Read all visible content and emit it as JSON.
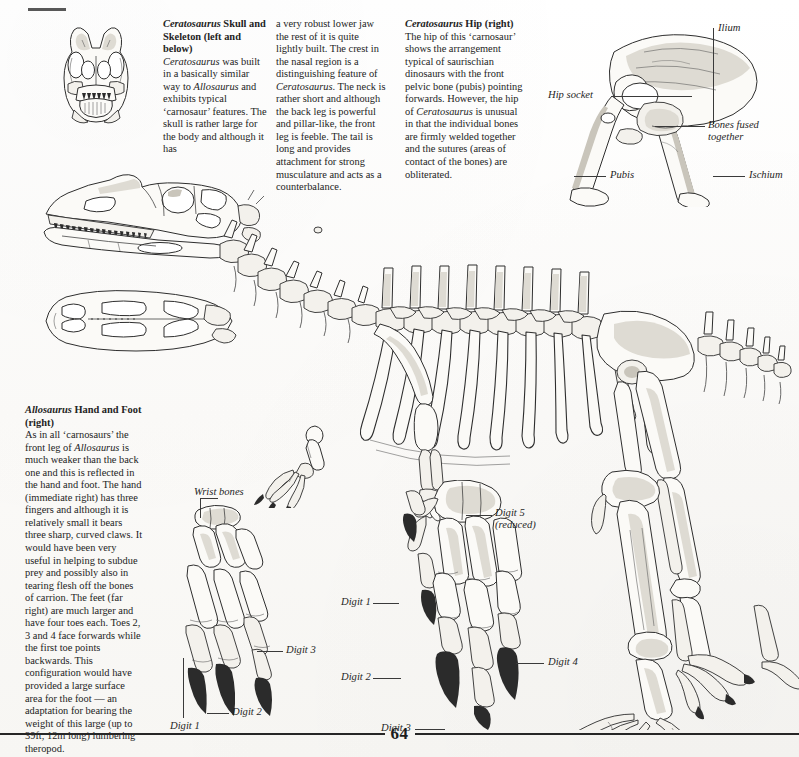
{
  "page": {
    "number": "64",
    "domain_note": "book page spread, dinosaur anatomy"
  },
  "articles": [
    {
      "id": "cerato-skull",
      "heading": "Ceratosaurus Skull and Skeleton (left and below)",
      "body_col1": "Ceratosaurus was built in a basically similar way to Allosaurus and exhibits typical ‘carnosaur’ features. The skull is rather large for the body and although it has",
      "body_col2": "a very robust lower jaw the rest of it is quite lightly built. The crest in the nasal region is a distinguishing feature of Ceratosaurus. The neck is rather short and although the back leg is powerful and pillar-like, the front leg is feeble. The tail is long and provides attachment for strong musculature and acts as a counterbalance."
    },
    {
      "id": "cerato-hip",
      "heading": "Ceratosaurus Hip (right)",
      "body": "The hip of this ‘carnosaur’ shows the arrangement typical of saurischian dinosaurs with the front pelvic bone (pubis) pointing forwards. However, the hip of Ceratosaurus is unusual in that the individual bones are firmly welded together and the sutures (areas of contact of the bones) are obliterated."
    },
    {
      "id": "allo-hand-foot",
      "heading": "Allosaurus Hand and Foot (right)",
      "body": "As in all ‘carnosaurs’ the front leg of Allosaurus is much weaker than the back one and this is reflected in the hand and foot. The hand (immediate right) has three fingers and although it is relatively small it bears three sharp, curved claws. It would have been very useful in helping to subdue prey and possibly also in tearing flesh off the bones of carrion. The feet (far right) are much larger and have four toes each. Toes 2, 3 and 4 face forwards while the first toe points backwards. This configuration would have provided a large surface area for the foot — an adaptation for bearing the weight of this large (up to 39ft, 12m long) lumbering theropod."
    }
  ],
  "figures": {
    "skull_front": {
      "name": "ceratosaurus-skull-front-view"
    },
    "skull_side": {
      "name": "ceratosaurus-skull-side-view"
    },
    "skull_top": {
      "name": "ceratosaurus-skull-top-view"
    },
    "skeleton": {
      "name": "ceratosaurus-full-skeleton"
    },
    "hip": {
      "name": "ceratosaurus-hip-diagram"
    },
    "hand_small": {
      "name": "allosaurus-hand-small-inset"
    },
    "hand_large": {
      "name": "allosaurus-hand-large"
    },
    "foot_large": {
      "name": "allosaurus-foot-large"
    },
    "foot_leg": {
      "name": "allosaurus-foot-and-leg"
    }
  },
  "hip_labels": {
    "ilium": "Ilium",
    "hip_socket": "Hip socket",
    "bones_fused": "Bones fused together",
    "pubis": "Pubis",
    "ischium": "Ischium"
  },
  "hand_labels": {
    "wrist_bones": "Wrist bones",
    "digit_3": "Digit 3",
    "digit_2": "Digit 2",
    "digit_1": "Digit 1"
  },
  "foot_labels": {
    "digit_5": "Digit 5 (reduced)",
    "digit_1": "Digit 1",
    "digit_2": "Digit 2",
    "digit_3": "Digit 3",
    "digit_4": "Digit 4"
  }
}
